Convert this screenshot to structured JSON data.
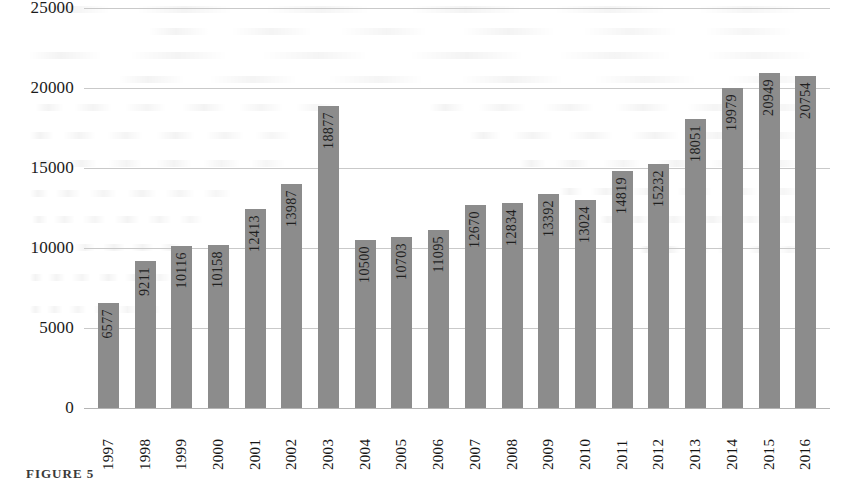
{
  "figure": {
    "caption": "FIGURE 5"
  },
  "chart_data": {
    "type": "bar",
    "title": "",
    "xlabel": "",
    "ylabel": "",
    "categories": [
      "1997",
      "1998",
      "1999",
      "2000",
      "2001",
      "2002",
      "2003",
      "2004",
      "2005",
      "2006",
      "2007",
      "2008",
      "2009",
      "2010",
      "2011",
      "2012",
      "2013",
      "2014",
      "2015",
      "2016"
    ],
    "values": [
      6577,
      9211,
      10116,
      10158,
      12413,
      13987,
      18877,
      10500,
      10703,
      11095,
      12670,
      12834,
      13392,
      13024,
      14819,
      15232,
      18051,
      19979,
      20949,
      20754
    ],
    "value_labels": [
      "6577",
      "9211",
      "10116",
      "10158",
      "12413",
      "13987",
      "18877",
      "10500",
      "10703",
      "11095",
      "12670",
      "12834",
      "13392",
      "13024",
      "14819",
      "15232",
      "18051",
      "19979",
      "20949",
      "20754"
    ],
    "ylim": [
      0,
      25000
    ],
    "yticks": [
      0,
      5000,
      10000,
      15000,
      20000,
      25000
    ],
    "ytick_labels": [
      "0",
      "5000",
      "10000",
      "15000",
      "20000",
      "25000"
    ],
    "grid": true,
    "legend": "none",
    "bar_color": "#8c8c8c",
    "gridline_color": "#c9c9c9",
    "text_color": "#1b1b1b"
  }
}
